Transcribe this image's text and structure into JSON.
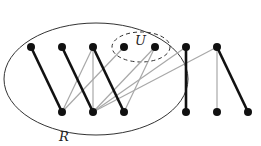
{
  "labels": {
    "R": "R",
    "U": "U"
  },
  "colors": {
    "strong_edge": "#111111",
    "weak_edge": "#a8a8a8",
    "node": "#111111",
    "outline": "#333333"
  },
  "top_nodes": [
    31,
    62,
    93,
    124,
    155,
    186,
    217
  ],
  "bottom_nodes": [
    62,
    93,
    124,
    186,
    217,
    248
  ],
  "strong_edges": [
    [
      31,
      62
    ],
    [
      62,
      93
    ],
    [
      93,
      124
    ],
    [
      186,
      186
    ],
    [
      217,
      248
    ]
  ],
  "weak_edges": [
    [
      93,
      62
    ],
    [
      93,
      93
    ],
    [
      124,
      62
    ],
    [
      155,
      93
    ],
    [
      155,
      124
    ],
    [
      186,
      93
    ],
    [
      217,
      93
    ],
    [
      217,
      217
    ]
  ]
}
